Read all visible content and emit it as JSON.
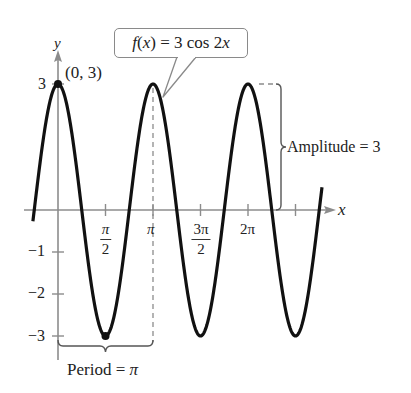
{
  "chart_data": {
    "type": "line",
    "title": "",
    "function": "f(x) = 3 cos 2x",
    "amplitude": 3,
    "angular_coefficient": 2,
    "period_label": "Period = π",
    "amplitude_label": "Amplitude = 3",
    "xlabel": "x",
    "ylabel": "y",
    "x_range": [
      -0.83,
      8.73
    ],
    "ylim": [
      -3,
      3
    ],
    "x_ticks": [
      {
        "value": 1.5708,
        "label_num": "π",
        "label_den": "2"
      },
      {
        "value": 3.1416,
        "label": "π"
      },
      {
        "value": 4.7124,
        "label_num": "3π",
        "label_den": "2"
      },
      {
        "value": 6.2832,
        "label": "2π"
      },
      {
        "value": 7.854,
        "label": ""
      }
    ],
    "y_ticks": [
      {
        "value": 3,
        "label": "3"
      },
      {
        "value": -1,
        "label": "−1"
      },
      {
        "value": -2,
        "label": "−2"
      },
      {
        "value": -3,
        "label": "−3"
      }
    ],
    "highlighted_points": [
      {
        "x": 0,
        "y": 3,
        "label": "(0, 3)"
      },
      {
        "x": 1.5708,
        "y": -3,
        "label": ""
      }
    ],
    "grid": false,
    "legend": null,
    "callout": "f(x) = 3 cos 2x"
  },
  "labels": {
    "y_axis": "y",
    "x_axis": "x",
    "point": "(0, 3)",
    "callout_f": "f",
    "callout_x": "x",
    "callout_eq": " = 3 cos 2",
    "callout_x2": "x",
    "amplitude": "Amplitude = 3",
    "period_text": "Period = ",
    "period_pi": "π",
    "tick_pi_half_num": "π",
    "tick_pi_half_den": "2",
    "tick_pi": "π",
    "tick_3pi_half_num": "3π",
    "tick_3pi_half_den": "2",
    "tick_2pi": "2π",
    "ytick_3": "3",
    "ytick_m1": "−1",
    "ytick_m2": "−2",
    "ytick_m3": "−3"
  },
  "colors": {
    "curve": "#111111",
    "axis": "#8c8c8c",
    "dashed": "#8c8c8c",
    "brace": "#555555",
    "text": "#222222"
  }
}
